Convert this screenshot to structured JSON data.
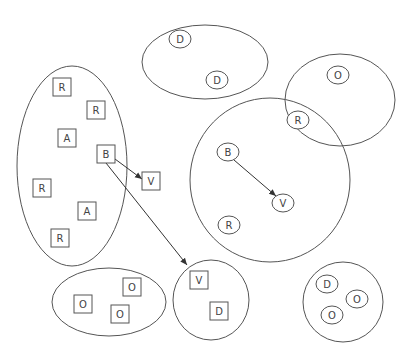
{
  "diagram": {
    "colors": {
      "stroke": "#555555",
      "edge": "#333333",
      "background": "#ffffff",
      "text": "#444444"
    },
    "groups": [
      {
        "id": "g-left",
        "shape": "ellipse",
        "cx": 72,
        "cy": 166,
        "rx": 55,
        "ry": 100
      },
      {
        "id": "g-top",
        "shape": "ellipse",
        "cx": 205,
        "cy": 62,
        "rx": 63,
        "ry": 37
      },
      {
        "id": "g-top-right",
        "shape": "ellipse",
        "cx": 340,
        "cy": 100,
        "rx": 55,
        "ry": 46
      },
      {
        "id": "g-big-circle",
        "shape": "ellipse",
        "cx": 270,
        "cy": 180,
        "rx": 80,
        "ry": 82
      },
      {
        "id": "g-bottom-left",
        "shape": "ellipse",
        "cx": 109,
        "cy": 302,
        "rx": 57,
        "ry": 34
      },
      {
        "id": "g-bottom-mid",
        "shape": "ellipse",
        "cx": 211,
        "cy": 300,
        "rx": 38,
        "ry": 40
      },
      {
        "id": "g-bottom-right",
        "shape": "ellipse",
        "cx": 343,
        "cy": 302,
        "rx": 40,
        "ry": 40
      }
    ],
    "nodes": [
      {
        "id": "n1",
        "shape": "square",
        "label": "R",
        "x": 62,
        "y": 87
      },
      {
        "id": "n2",
        "shape": "square",
        "label": "R",
        "x": 96,
        "y": 110
      },
      {
        "id": "n3",
        "shape": "square",
        "label": "A",
        "x": 67,
        "y": 138
      },
      {
        "id": "n4",
        "shape": "square",
        "label": "B",
        "x": 106,
        "y": 154
      },
      {
        "id": "n5",
        "shape": "square",
        "label": "V",
        "x": 151,
        "y": 181
      },
      {
        "id": "n6",
        "shape": "square",
        "label": "R",
        "x": 42,
        "y": 188
      },
      {
        "id": "n7",
        "shape": "square",
        "label": "A",
        "x": 87,
        "y": 211
      },
      {
        "id": "n8",
        "shape": "square",
        "label": "R",
        "x": 60,
        "y": 238
      },
      {
        "id": "n9",
        "shape": "circle",
        "label": "D",
        "x": 180,
        "y": 39
      },
      {
        "id": "n10",
        "shape": "circle",
        "label": "D",
        "x": 217,
        "y": 80
      },
      {
        "id": "n11",
        "shape": "circle",
        "label": "O",
        "x": 338,
        "y": 75
      },
      {
        "id": "n12",
        "shape": "circle",
        "label": "R",
        "x": 298,
        "y": 120
      },
      {
        "id": "n13",
        "shape": "circle",
        "label": "B",
        "x": 228,
        "y": 152
      },
      {
        "id": "n14",
        "shape": "circle",
        "label": "V",
        "x": 283,
        "y": 203
      },
      {
        "id": "n15",
        "shape": "circle",
        "label": "R",
        "x": 229,
        "y": 225
      },
      {
        "id": "n16",
        "shape": "square",
        "label": "O",
        "x": 132,
        "y": 287
      },
      {
        "id": "n17",
        "shape": "square",
        "label": "O",
        "x": 83,
        "y": 304
      },
      {
        "id": "n18",
        "shape": "square",
        "label": "O",
        "x": 120,
        "y": 314
      },
      {
        "id": "n19",
        "shape": "square",
        "label": "V",
        "x": 199,
        "y": 280
      },
      {
        "id": "n20",
        "shape": "square",
        "label": "D",
        "x": 219,
        "y": 311
      },
      {
        "id": "n21",
        "shape": "circle",
        "label": "D",
        "x": 327,
        "y": 284
      },
      {
        "id": "n22",
        "shape": "circle",
        "label": "O",
        "x": 357,
        "y": 299
      },
      {
        "id": "n23",
        "shape": "circle",
        "label": "O",
        "x": 332,
        "y": 315
      }
    ],
    "edges": [
      {
        "from": "n4",
        "to": "n5",
        "x1": 115,
        "y1": 159,
        "x2": 142,
        "y2": 179
      },
      {
        "from": "n4",
        "to": "n19",
        "x1": 106,
        "y1": 163,
        "x2": 187,
        "y2": 265
      },
      {
        "from": "n13",
        "to": "n14",
        "x1": 234,
        "y1": 160,
        "x2": 276,
        "y2": 196
      }
    ]
  }
}
